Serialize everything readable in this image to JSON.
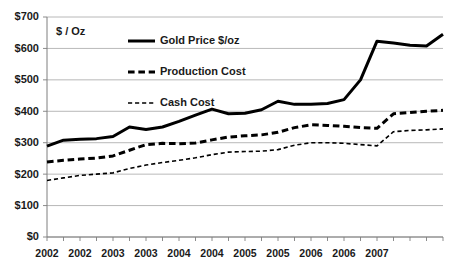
{
  "chart_data": {
    "type": "line",
    "title": "",
    "subtitle": "",
    "xlabel": "",
    "ylabel": "$ / Oz",
    "ylim": [
      0,
      700
    ],
    "ytick_values": [
      0,
      100,
      200,
      300,
      400,
      500,
      600,
      700
    ],
    "ytick_labels": [
      "$0",
      "$100",
      "$200",
      "$300",
      "$400",
      "$500",
      "$600",
      "$700"
    ],
    "grid": true,
    "legend_position": "inside-top-left",
    "x": [
      "2002 Q1",
      "2002 Q2",
      "2002 Q3",
      "2002 Q4",
      "2003 Q1",
      "2003 Q2",
      "2003 Q3",
      "2003 Q4",
      "2004 Q1",
      "2004 Q2",
      "2004 Q3",
      "2004 Q4",
      "2005 Q1",
      "2005 Q2",
      "2005 Q3",
      "2005 Q4",
      "2006 Q1",
      "2006 Q2",
      "2006 Q3",
      "2006 Q4",
      "2007 Q1"
    ],
    "xtick_labels": [
      "2002",
      "",
      "2002",
      "",
      "2003",
      "",
      "2003",
      "",
      "2004",
      "",
      "2004",
      "",
      "2005",
      "",
      "2005",
      "",
      "2006",
      "",
      "2006",
      "",
      "2007"
    ],
    "xtick_labels_shown": [
      "2002",
      "2002",
      "2003",
      "2003",
      "2004",
      "2004",
      "2005",
      "2005",
      "2006",
      "2006",
      "2007"
    ],
    "series": [
      {
        "name": "Gold Price $/oz",
        "style": "solid",
        "color": "#000000",
        "width": 3,
        "values": [
          289,
          308,
          311,
          313,
          320,
          350,
          342,
          350,
          368,
          388,
          407,
          392,
          394,
          405,
          432,
          422,
          422,
          425,
          437,
          500,
          623
        ]
      },
      {
        "name": "Production Cost",
        "style": "dashed",
        "color": "#000000",
        "width": 3,
        "values": [
          239,
          244,
          248,
          251,
          258,
          276,
          294,
          298,
          297,
          299,
          309,
          318,
          322,
          325,
          333,
          348,
          357,
          355,
          352,
          348,
          346
        ]
      },
      {
        "name": "Cash Cost",
        "style": "dotted",
        "color": "#000000",
        "width": 1.6,
        "values": [
          180,
          188,
          196,
          200,
          204,
          218,
          229,
          237,
          244,
          252,
          262,
          270,
          272,
          273,
          278,
          292,
          300,
          300,
          298,
          294,
          290
        ]
      }
    ],
    "series_tail": {
      "note_gold_extension": [
        623,
        617,
        610,
        608,
        645
      ],
      "note_production_extension": [
        388,
        392,
        396,
        400,
        403
      ],
      "note_cash_extension": [
        331,
        335,
        339,
        341,
        344
      ]
    },
    "legend": [
      {
        "label": "Gold Price $/oz",
        "style": "solid"
      },
      {
        "label": "Production Cost",
        "style": "dashed"
      },
      {
        "label": "Cash Cost",
        "style": "dotted"
      }
    ]
  }
}
